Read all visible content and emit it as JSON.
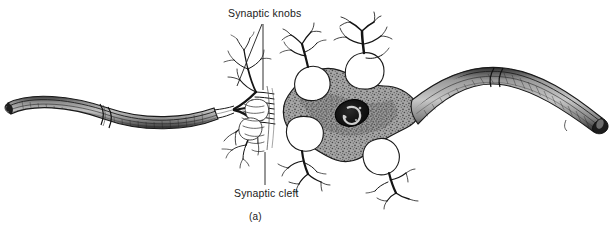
{
  "figure": {
    "caption": "(a)",
    "labels": {
      "synaptic_knobs": "Synaptic knobs",
      "synaptic_cleft": "Synaptic cleft"
    },
    "colors": {
      "ink": "#1a1a1a",
      "soma_fill": "#9a9a9a",
      "axon_fill": "#a8a8a8",
      "axon_shade": "#6f6f6f",
      "nucleus": "#141414",
      "nucleolus": "#c9c9c9",
      "background": "#ffffff"
    },
    "structures": [
      "presynaptic-myelinated-axon",
      "node-of-ranvier",
      "synaptic-knobs",
      "synaptic-cleft",
      "postsynaptic-soma",
      "nucleus",
      "nucleolus",
      "dendrites",
      "axon-hillock",
      "postsynaptic-myelinated-axon",
      "cut-axon-end"
    ]
  }
}
